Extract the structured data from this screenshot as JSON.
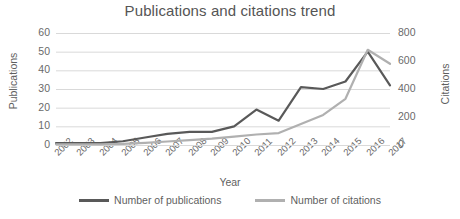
{
  "chart_data": {
    "type": "line",
    "title": "Publications and citations trend",
    "xlabel": "Year",
    "ylabel": "Publications",
    "y2label": "Citations",
    "categories": [
      "2002",
      "2003",
      "2004",
      "2005",
      "2006",
      "2007",
      "2008",
      "2009",
      "2010",
      "2011",
      "2012",
      "2013",
      "2014",
      "2015",
      "2016",
      "2017"
    ],
    "ylim": [
      0,
      60
    ],
    "y2lim": [
      0,
      800
    ],
    "yticks": [
      0,
      10,
      20,
      30,
      40,
      50,
      60
    ],
    "y2ticks": [
      0,
      200,
      400,
      600,
      800
    ],
    "grid": true,
    "legend_position": "bottom",
    "series": [
      {
        "name": "Number of publications",
        "axis": "left",
        "color": "#595959",
        "values": [
          1,
          1,
          1,
          2,
          4,
          6,
          7,
          7,
          10,
          19,
          13,
          31,
          30,
          34,
          50,
          32
        ]
      },
      {
        "name": "Number of citations",
        "axis": "right",
        "color": "#b0b0b0",
        "values": [
          5,
          5,
          5,
          8,
          15,
          25,
          35,
          45,
          60,
          75,
          85,
          150,
          215,
          330,
          680,
          580
        ]
      }
    ]
  },
  "legend": {
    "items": [
      {
        "label": "Number of publications",
        "color": "#595959"
      },
      {
        "label": "Number of citations",
        "color": "#b0b0b0"
      }
    ]
  }
}
